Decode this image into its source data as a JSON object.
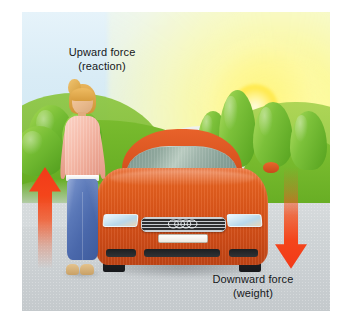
{
  "figure": {
    "type": "physics-force-diagram",
    "background_color": "#ffffff",
    "illustration_background": "#dceef7"
  },
  "labels": {
    "upward": {
      "line1": "Upward force",
      "line2": "(reaction)"
    },
    "downward": {
      "line1": "Downward force",
      "line2": "(weight)"
    }
  },
  "arrows": {
    "up": {
      "name": "upward-force-arrow",
      "direction": "up",
      "color_head": "#f4381a",
      "color_tail": "#f4592a",
      "fade": "fades-to-transparent-at-bottom"
    },
    "down": {
      "name": "downward-force-arrow",
      "direction": "down",
      "color_head": "#f4381a",
      "color_tail": "#f4592a",
      "fade": "fades-to-transparent-at-top"
    }
  },
  "scene": {
    "sky_color": "#d9ecf6",
    "sun_color": "#ffe94f",
    "grass_color": "#5fa81f",
    "road_color": "#cfd4d6",
    "car": {
      "name": "car",
      "make_badge": "audi-four-rings",
      "body_color": "#dc561a",
      "glass_color": "#8fa79c",
      "tyre_color": "#1b1d20",
      "plate_color": "#fdfdfb"
    },
    "person": {
      "name": "person",
      "hair_color": "#d79d3f",
      "top_color": "#f6bdac",
      "belt_color": "#ffffff",
      "jeans_color": "#4a68ab",
      "shoe_color": "#c8a065"
    }
  }
}
